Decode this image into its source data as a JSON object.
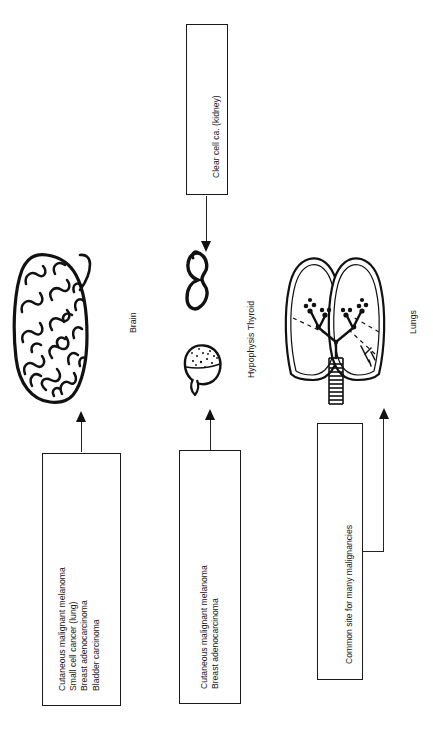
{
  "figure": {
    "orientation": "text rotated 90 degrees counter-clockwise"
  },
  "organs": [
    {
      "id": "brain",
      "label": "Brain",
      "icon": "brain-illustration"
    },
    {
      "id": "thyroid",
      "label": "Hypophysis Thyroid",
      "icon": "thyroid-illustration"
    },
    {
      "id": "hypophysis",
      "label": "",
      "icon": "hypophysis-illustration"
    },
    {
      "id": "lungs",
      "label": "Lungs",
      "icon": "lungs-illustration"
    }
  ],
  "boxes": {
    "kidney": {
      "lines": [
        "Clear cell ca. (kidney)"
      ],
      "text": "Clear cell ca. (kidney)"
    },
    "brain_primaries": {
      "lines": [
        "Cutaneous malignant melanoma",
        "Small cell cancer (lung)",
        "Breast adenocarcinoma",
        "Bladder carcinoma"
      ],
      "text": "Cutaneous malignant melanoma\nSmall cell cancer (lung)\nBreast adenocarcinoma\nBladder carcinoma"
    },
    "pituitary_primaries": {
      "lines": [
        "Cutaneous malignant melanoma",
        "Breast adenocarcinoma"
      ],
      "text": "Cutaneous malignant melanoma\nBreast adenocarcinoma"
    },
    "lung_note": {
      "lines": [
        "Common site for many malignancies"
      ],
      "text": "Common site for many malignancies"
    }
  },
  "arrows": [
    {
      "id": "kidney-to-thyroid",
      "direction": "down"
    },
    {
      "id": "primaries-to-brain",
      "direction": "up"
    },
    {
      "id": "primaries-to-hypophysis",
      "direction": "up"
    },
    {
      "id": "note-to-lungs",
      "direction": "up-elbow"
    }
  ],
  "colors": {
    "ink": "#1a1a1a",
    "background": "#ffffff"
  }
}
